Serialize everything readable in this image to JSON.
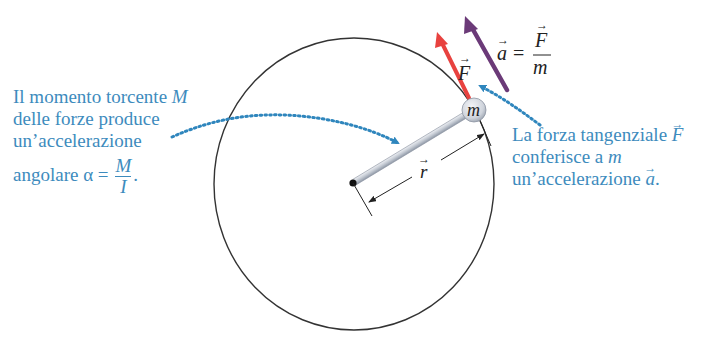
{
  "diagram": {
    "colors": {
      "circle": "#333333",
      "caption_text": "#3d8bbd",
      "dotted_arrow": "#2f86bd",
      "force_arrow": "#e8423f",
      "accel_arrow": "#6b3a78",
      "rod": "#c9ced6",
      "rod_edge": "#8e96a3",
      "mass_fill": "#d7dbe2",
      "label_dark": "#222222"
    },
    "circle": {
      "cx": 354,
      "cy": 184,
      "rx": 140,
      "ry": 146
    },
    "pivot": {
      "x": 353,
      "y": 183
    },
    "mass": {
      "x": 474,
      "y": 110,
      "r": 12,
      "label": "m"
    },
    "force_vector": {
      "label": "F",
      "from": [
        469,
        98
      ],
      "to": [
        437,
        33
      ]
    },
    "acceleration_vector": {
      "label": "a",
      "from": [
        507,
        90
      ],
      "to": [
        466,
        17
      ]
    },
    "acceleration_formula": {
      "lhs": "a",
      "equals": "=",
      "numerator": "F",
      "denominator": "m"
    },
    "radius_vector": {
      "label": "r"
    },
    "left_caption": {
      "line1_text": "Il momento torcente ",
      "line1_symbol": "M",
      "line2": "delle forze produce",
      "line3": "un’accelerazione",
      "line4_text": "angolare α =",
      "line4_numerator": "M",
      "line4_denominator": "I",
      "line4_end": "."
    },
    "right_caption": {
      "line1_text": "La forza tangenziale ",
      "line1_symbol": "F",
      "line2_text": "conferisce a ",
      "line2_symbol": "m",
      "line3_text": "un’accelerazione ",
      "line3_symbol": "a",
      "line3_end": "."
    }
  }
}
